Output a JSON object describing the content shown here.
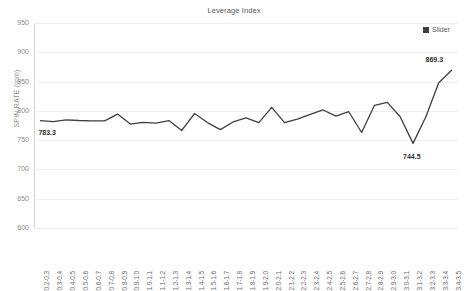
{
  "chart_data": {
    "type": "line",
    "title": "Leverage Index",
    "xlabel": "",
    "ylabel": "SPIN RATE (rpm)",
    "ylim": [
      600,
      950
    ],
    "ytick_step": 50,
    "yticks": [
      950,
      900,
      850,
      800,
      750,
      700,
      650,
      600
    ],
    "grid": true,
    "legend_position": "top-right",
    "legend": [
      "Slider"
    ],
    "series_color": "#3f3f3f",
    "categories": [
      "0.2-0.3",
      "0.3-0.4",
      "0.4-0.5",
      "0.5-0.6",
      "0.6-0.7",
      "0.7-0.8",
      "0.8-0.9",
      "0.9-1.0",
      "1.0-1.1",
      "1.1-1.2",
      "1.2-1.3",
      "1.3-1.4",
      "1.4-1.5",
      "1.5-1.6",
      "1.6-1.7",
      "1.7-1.8",
      "1.8-1.9",
      "1.9-2.0",
      "2.0-2.1",
      "2.1-2.2",
      "2.2-2.3",
      "2.3-2.4",
      "2.4-2.5",
      "2.5-2.6",
      "2.6-2.7",
      "2.7-2.8",
      "2.8-2.9",
      "2.9-3.0",
      "3.0-3.1",
      "3.1-3.2",
      "3.2-3.3",
      "3.3-3.4",
      "3.4-3.5"
    ],
    "series": [
      {
        "name": "Slider",
        "values": [
          783.3,
          781.5,
          784.5,
          783.5,
          783.0,
          783.0,
          794.5,
          777.5,
          780.5,
          779.0,
          783.5,
          766.5,
          795.5,
          780.0,
          768.0,
          781.0,
          788.0,
          780.0,
          806.0,
          780.0,
          786.0,
          794.0,
          801.5,
          791.0,
          798.5,
          763.0,
          809.5,
          814.5,
          790.0,
          744.5,
          790.0,
          848.0,
          869.3
        ]
      }
    ],
    "annotations": [
      {
        "label": "783.3",
        "category": "0.2-0.3",
        "value": 783.3
      },
      {
        "label": "744.5",
        "category": "3.1-3.2",
        "value": 744.5
      },
      {
        "label": "869.3",
        "category": "3.4-3.5",
        "value": 869.3
      }
    ]
  }
}
